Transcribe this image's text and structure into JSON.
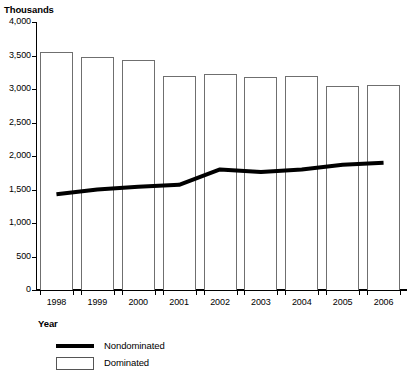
{
  "chart_data": {
    "type": "bar",
    "title": "",
    "subtitle": "",
    "unit_caption": "Thousands",
    "xlabel": "Year",
    "ylabel": "",
    "categories": [
      "1998",
      "1999",
      "2000",
      "2001",
      "2002",
      "2003",
      "2004",
      "2005",
      "2006"
    ],
    "ylim": [
      0,
      4000
    ],
    "ytick_values": [
      0,
      500,
      1000,
      1500,
      2000,
      2500,
      3000,
      3500,
      4000
    ],
    "ytick_labels": [
      "0",
      "500",
      "1,000",
      "1,500",
      "2,000",
      "2,500",
      "3,000",
      "3,500",
      "4,000"
    ],
    "grid": false,
    "legend_position": "bottom-left",
    "series": [
      {
        "name": "Dominated",
        "render": "bar",
        "color": "#ffffff",
        "edge_color": "#6f6f6f",
        "values": [
          3550,
          3480,
          3430,
          3200,
          3230,
          3180,
          3200,
          3050,
          3060
        ]
      },
      {
        "name": "Nondominated",
        "render": "line",
        "color": "#000000",
        "values": [
          1430,
          1500,
          1540,
          1570,
          1800,
          1760,
          1800,
          1870,
          1900
        ]
      }
    ]
  },
  "legend": {
    "items": [
      {
        "label": "Nondominated",
        "symbol": "line-swatch"
      },
      {
        "label": "Dominated",
        "symbol": "box-swatch"
      }
    ]
  }
}
